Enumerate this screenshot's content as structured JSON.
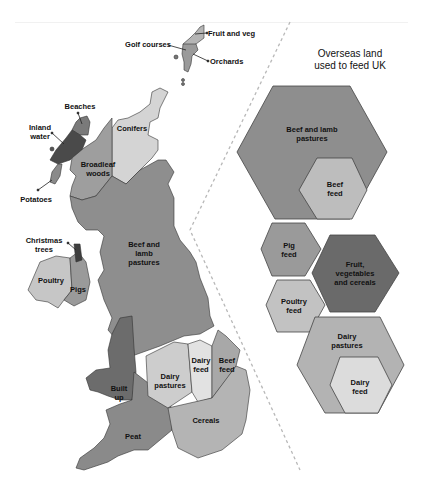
{
  "colors": {
    "beef_lamb": "#8e8e8e",
    "beef_feed": "#bdbdbd",
    "pig_feed": "#9a9a9a",
    "fruit_veg_cereals": "#6a6a6a",
    "poultry_feed": "#c2c2c2",
    "dairy_pastures": "#b3b3b3",
    "dairy_feed": "#dcdcdc",
    "conifers": "#d4d4d4",
    "broadleaf": "#9e9e9e",
    "inland_water": "#4a4a4a",
    "beaches": "#7a7a7a",
    "potatoes": "#8a8a8a",
    "christmas_trees": "#3e3e3e",
    "poultry": "#c6c6c6",
    "pigs": "#9a9a9a",
    "built_up": "#6c6c6c",
    "peat": "#8a8a8a",
    "cereals": "#b4b4b4",
    "uk_dairy_pastures": "#cdcdcd",
    "uk_dairy_feed": "#e2e2e2",
    "uk_beef_feed": "#a8a8a8",
    "fruit_and_veg": "#b5b5b5",
    "orchards": "#9a9a9a",
    "divider": "#b8b8b8"
  },
  "overseas": {
    "title": "Overseas land\nused to feed UK",
    "hexes": [
      {
        "id": "beef-lamb-pastures",
        "label": "Beef and lamb\npastures"
      },
      {
        "id": "beef-feed",
        "label": "Beef\nfeed"
      },
      {
        "id": "pig-feed",
        "label": "Pig\nfeed"
      },
      {
        "id": "fruit-veg-cereals",
        "label": "Fruit,\nvegetables\nand cereals"
      },
      {
        "id": "poultry-feed",
        "label": "Poultry\nfeed"
      },
      {
        "id": "dairy-pastures",
        "label": "Dairy\npastures"
      },
      {
        "id": "dairy-feed",
        "label": "Dairy\nfeed"
      }
    ]
  },
  "uk_map": {
    "labels": {
      "golf_courses": "Golf courses",
      "fruit_and_veg": "Fruit and veg",
      "orchards": "Orchards",
      "beaches": "Beaches",
      "inland_water": "Inland\nwater",
      "conifers": "Conifers",
      "broadleaf_woods": "Broadleaf\nwoods",
      "potatoes": "Potatoes",
      "christmas_trees": "Christmas\ntrees",
      "beef_and_lamb_pastures": "Beef and\nlamb\npastures",
      "poultry": "Poultry",
      "pigs": "Pigs",
      "dairy_feed": "Dairy\nfeed",
      "beef_feed": "Beef\nfeed",
      "dairy_pastures": "Dairy\npastures",
      "built_up": "Built\nup",
      "cereals": "Cereals",
      "peat": "Peat"
    }
  }
}
